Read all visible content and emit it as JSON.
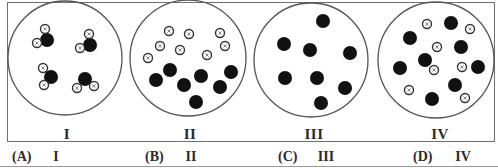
{
  "figure": {
    "panels": [
      {
        "id": "I",
        "label": "I",
        "label_x": 67,
        "circle": {
          "cx": 65,
          "cy": 58,
          "r": 57
        },
        "description": "four molecules, each one large dark atom bonded to two small light atoms",
        "dark_atoms": [
          {
            "x": 47,
            "y": 40
          },
          {
            "x": 90,
            "y": 45
          },
          {
            "x": 51,
            "y": 77
          },
          {
            "x": 85,
            "y": 79
          }
        ],
        "light_atoms": [
          {
            "x": 45,
            "y": 29
          },
          {
            "x": 37,
            "y": 43
          },
          {
            "x": 89,
            "y": 34
          },
          {
            "x": 80,
            "y": 48
          },
          {
            "x": 43,
            "y": 68
          },
          {
            "x": 44,
            "y": 85
          },
          {
            "x": 77,
            "y": 88
          },
          {
            "x": 94,
            "y": 86
          }
        ]
      },
      {
        "id": "II",
        "label": "II",
        "label_x": 190,
        "circle": {
          "cx": 188,
          "cy": 58,
          "r": 58
        },
        "description": "separate small light atoms and separate large dark atoms (mixture of elements)",
        "dark_atoms": [
          {
            "x": 170,
            "y": 70
          },
          {
            "x": 156,
            "y": 80
          },
          {
            "x": 184,
            "y": 85
          },
          {
            "x": 201,
            "y": 76
          },
          {
            "x": 231,
            "y": 72
          },
          {
            "x": 220,
            "y": 87
          },
          {
            "x": 196,
            "y": 102
          }
        ],
        "light_atoms": [
          {
            "x": 169,
            "y": 31
          },
          {
            "x": 189,
            "y": 34
          },
          {
            "x": 220,
            "y": 33
          },
          {
            "x": 160,
            "y": 46
          },
          {
            "x": 180,
            "y": 50
          },
          {
            "x": 225,
            "y": 46
          },
          {
            "x": 148,
            "y": 58
          },
          {
            "x": 207,
            "y": 55
          }
        ]
      },
      {
        "id": "III",
        "label": "III",
        "label_x": 314,
        "circle": {
          "cx": 311,
          "cy": 60,
          "r": 57
        },
        "description": "only large dark atoms (an element)",
        "dark_atoms": [
          {
            "x": 323,
            "y": 21
          },
          {
            "x": 284,
            "y": 44
          },
          {
            "x": 310,
            "y": 50
          },
          {
            "x": 350,
            "y": 53
          },
          {
            "x": 285,
            "y": 78
          },
          {
            "x": 317,
            "y": 78
          },
          {
            "x": 345,
            "y": 88
          },
          {
            "x": 321,
            "y": 103
          }
        ],
        "light_atoms": []
      },
      {
        "id": "IV",
        "label": "IV",
        "label_x": 440,
        "circle": {
          "cx": 436,
          "cy": 60,
          "r": 58
        },
        "description": "mixture of separate large dark atoms and small light atoms",
        "dark_atoms": [
          {
            "x": 451,
            "y": 23
          },
          {
            "x": 410,
            "y": 38
          },
          {
            "x": 461,
            "y": 47
          },
          {
            "x": 425,
            "y": 60
          },
          {
            "x": 400,
            "y": 68
          },
          {
            "x": 478,
            "y": 67
          },
          {
            "x": 455,
            "y": 85
          },
          {
            "x": 432,
            "y": 99
          }
        ],
        "light_atoms": [
          {
            "x": 427,
            "y": 24
          },
          {
            "x": 470,
            "y": 29
          },
          {
            "x": 437,
            "y": 47
          },
          {
            "x": 434,
            "y": 70
          },
          {
            "x": 462,
            "y": 67
          },
          {
            "x": 409,
            "y": 90
          },
          {
            "x": 465,
            "y": 98
          }
        ]
      }
    ],
    "style": {
      "frame_color": "#6f6f6f",
      "circle_stroke": "#555555",
      "dark_atom_color": "#111111",
      "light_atom_fill": "#ffffff",
      "light_atom_stroke": "#333333",
      "dark_atom_radius": 7,
      "light_atom_radius": 4.5
    }
  },
  "options": [
    {
      "letter": "(A)",
      "value": "I",
      "letter_x": 12,
      "value_x": 56
    },
    {
      "letter": "(B)",
      "value": "II",
      "letter_x": 145,
      "value_x": 191
    },
    {
      "letter": "(C)",
      "value": "III",
      "letter_x": 278,
      "value_x": 326
    },
    {
      "letter": "(D)",
      "value": "IV",
      "letter_x": 413,
      "value_x": 463
    }
  ]
}
